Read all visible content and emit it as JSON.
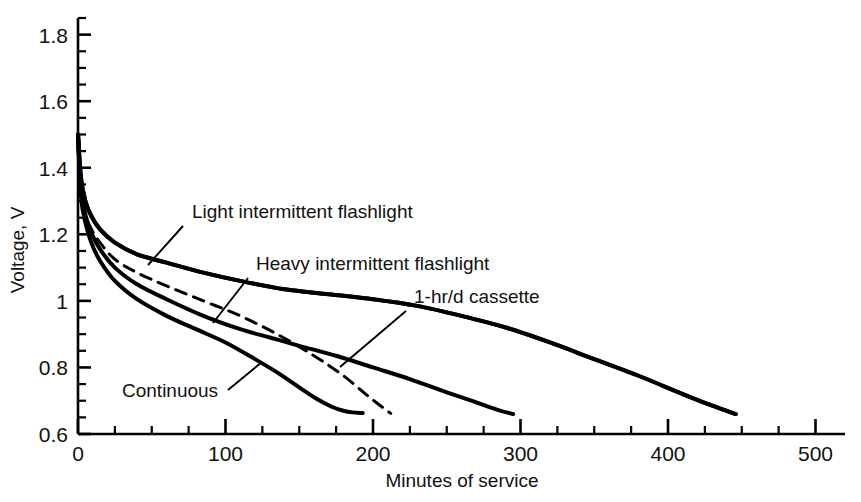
{
  "chart_data": {
    "type": "line",
    "title": "",
    "xlabel": "Minutes of service",
    "ylabel": "Voltage, V",
    "xlim": [
      0,
      520
    ],
    "ylim": [
      0.6,
      1.85
    ],
    "grid": false,
    "legend_position": "inline-annotations",
    "x_ticks": [
      0,
      100,
      200,
      300,
      400,
      500
    ],
    "x_tick_labels": [
      "0",
      "100",
      "200",
      "300",
      "400",
      "500"
    ],
    "x_minor_step": 25,
    "y_ticks": [
      0.6,
      0.8,
      1.0,
      1.2,
      1.4,
      1.6,
      1.8
    ],
    "y_tick_labels": [
      "0.6",
      "0.8",
      "1",
      "1.2",
      "1.4",
      "1.6",
      "1.8"
    ],
    "y_minor_step": 0.05,
    "series": [
      {
        "name": "Light intermittent flashlight",
        "style": "solid",
        "color": "#000000",
        "x": [
          0,
          2,
          5,
          9,
          15,
          25,
          40,
          60,
          85,
          110,
          140,
          170,
          200,
          230,
          260,
          290,
          320,
          350,
          380,
          410,
          430,
          446
        ],
        "y": [
          1.5,
          1.37,
          1.3,
          1.255,
          1.215,
          1.175,
          1.14,
          1.115,
          1.085,
          1.06,
          1.035,
          1.02,
          1.005,
          0.985,
          0.955,
          0.92,
          0.875,
          0.825,
          0.775,
          0.72,
          0.685,
          0.66
        ]
      },
      {
        "name": "Heavy intermittent flashlight",
        "style": "solid",
        "color": "#000000",
        "x": [
          0,
          2,
          5,
          9,
          15,
          25,
          40,
          60,
          85,
          110,
          130,
          150,
          175,
          200,
          225,
          250,
          270,
          285,
          295
        ],
        "y": [
          1.5,
          1.34,
          1.26,
          1.205,
          1.155,
          1.1,
          1.05,
          1.005,
          0.955,
          0.915,
          0.89,
          0.865,
          0.835,
          0.8,
          0.765,
          0.725,
          0.695,
          0.672,
          0.66
        ]
      },
      {
        "name": "1-hr/d cassette",
        "style": "solid",
        "color": "#000000",
        "x": [
          0,
          2,
          5,
          9,
          15,
          25,
          40,
          60,
          85,
          110,
          140,
          170,
          200,
          230,
          260,
          290,
          320,
          350,
          380,
          410,
          430,
          446
        ],
        "y": [
          1.5,
          1.37,
          1.3,
          1.255,
          1.215,
          1.175,
          1.14,
          1.115,
          1.085,
          1.06,
          1.035,
          1.02,
          1.005,
          0.985,
          0.955,
          0.92,
          0.875,
          0.825,
          0.775,
          0.72,
          0.685,
          0.66
        ]
      },
      {
        "name": "Continuous",
        "style": "solid",
        "color": "#000000",
        "x": [
          0,
          2,
          5,
          9,
          15,
          25,
          40,
          60,
          80,
          100,
          120,
          135,
          150,
          162,
          172,
          180,
          186,
          193
        ],
        "y": [
          1.5,
          1.315,
          1.235,
          1.175,
          1.12,
          1.06,
          1.005,
          0.955,
          0.915,
          0.875,
          0.825,
          0.785,
          0.74,
          0.705,
          0.682,
          0.67,
          0.665,
          0.663
        ]
      },
      {
        "name": "dashed-unlabeled",
        "style": "dashed",
        "color": "#000000",
        "x": [
          0,
          3,
          8,
          15,
          25,
          40,
          60,
          85,
          110,
          135,
          160,
          180,
          195,
          205,
          212
        ],
        "y": [
          1.46,
          1.29,
          1.225,
          1.175,
          1.125,
          1.085,
          1.045,
          1.0,
          0.955,
          0.9,
          0.835,
          0.775,
          0.72,
          0.685,
          0.662
        ]
      }
    ],
    "annotations": [
      {
        "text": "Light intermittent flashlight",
        "text_x": 192,
        "text_y": 218,
        "leader_from_x": 183,
        "leader_from_y": 226,
        "leader_to_x": 148,
        "leader_to_y": 265
      },
      {
        "text": "Heavy intermittent flashlight",
        "text_x": 256,
        "text_y": 270,
        "leader_from_x": 248,
        "leader_from_y": 278,
        "leader_to_x": 213,
        "leader_to_y": 323
      },
      {
        "text": "1-hr/d cassette",
        "text_x": 414,
        "text_y": 303,
        "leader_from_x": 406,
        "leader_from_y": 311,
        "leader_to_x": 340,
        "leader_to_y": 367
      },
      {
        "text": "Continuous",
        "text_x": 122,
        "text_y": 397,
        "leader_from_x": 228,
        "leader_from_y": 390,
        "leader_to_x": 262,
        "leader_to_y": 362
      }
    ]
  },
  "caption": {
    "clipped_bottom_line": ""
  }
}
